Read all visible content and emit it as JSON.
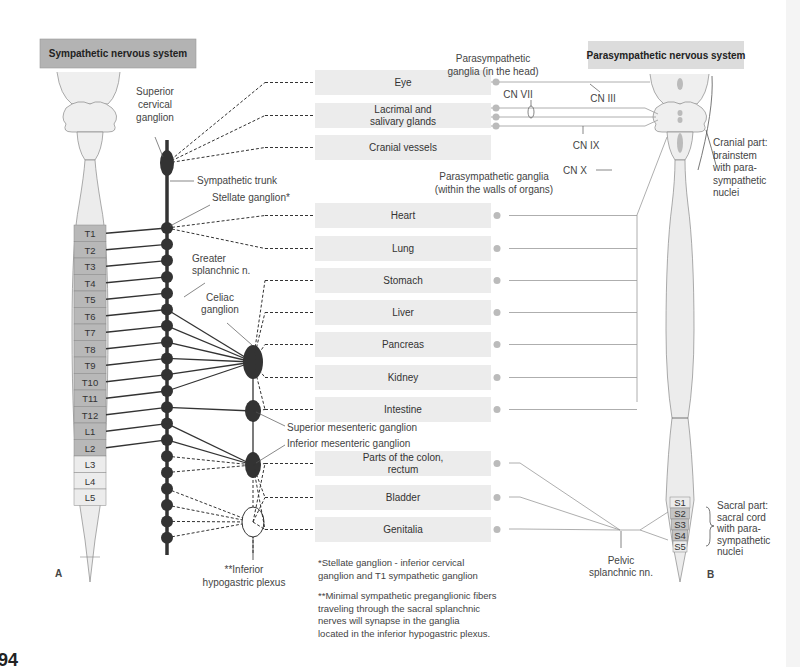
{
  "page_number": "94",
  "headers": {
    "sympathetic": "Sympathetic nervous system",
    "parasympathetic": "Parasympathetic nervous system",
    "sympathetic_color": "#b3b3b3",
    "parasympathetic_color": "#dcdcdc"
  },
  "panel_labels": {
    "left": "A",
    "right": "B"
  },
  "organs": [
    {
      "label": "Eye",
      "lines": [
        "Eye"
      ],
      "group": "head"
    },
    {
      "label": "Lacrimal and salivary glands",
      "lines": [
        "Lacrimal and",
        "salivary glands"
      ],
      "group": "head"
    },
    {
      "label": "Cranial vessels",
      "lines": [
        "Cranial vessels"
      ],
      "group": "head"
    },
    {
      "label": "Heart",
      "lines": [
        "Heart"
      ],
      "group": "vagal"
    },
    {
      "label": "Lung",
      "lines": [
        "Lung"
      ],
      "group": "vagal"
    },
    {
      "label": "Stomach",
      "lines": [
        "Stomach"
      ],
      "group": "vagal"
    },
    {
      "label": "Liver",
      "lines": [
        "Liver"
      ],
      "group": "vagal"
    },
    {
      "label": "Pancreas",
      "lines": [
        "Pancreas"
      ],
      "group": "vagal"
    },
    {
      "label": "Kidney",
      "lines": [
        "Kidney"
      ],
      "group": "vagal"
    },
    {
      "label": "Intestine",
      "lines": [
        "Intestine"
      ],
      "group": "vagal"
    },
    {
      "label": "Parts of the colon, rectum",
      "lines": [
        "Parts of the colon,",
        "rectum"
      ],
      "group": "pelvic"
    },
    {
      "label": "Bladder",
      "lines": [
        "Bladder"
      ],
      "group": "pelvic"
    },
    {
      "label": "Genitalia",
      "lines": [
        "Genitalia"
      ],
      "group": "pelvic"
    }
  ],
  "sympathetic_segments": {
    "active": [
      "T1",
      "T2",
      "T3",
      "T4",
      "T5",
      "T6",
      "T7",
      "T8",
      "T9",
      "T10",
      "T11",
      "T12",
      "L1",
      "L2"
    ],
    "inactive": [
      "L3",
      "L4",
      "L5"
    ],
    "active_color": "#b8b8b8",
    "inactive_color": "#ececec"
  },
  "sacral_segments": {
    "all": [
      "S1",
      "S2",
      "S3",
      "S4",
      "S5"
    ],
    "active": [
      "S2",
      "S3",
      "S4"
    ]
  },
  "labels": {
    "superior_cervical": [
      "Superior",
      "cervical",
      "ganglion"
    ],
    "sympathetic_trunk": "Sympathetic trunk",
    "stellate": "Stellate ganglion*",
    "greater_splanchnic": [
      "Greater",
      "splanchnic n."
    ],
    "celiac": [
      "Celiac",
      "ganglion"
    ],
    "superior_mesenteric": "Superior mesenteric ganglion",
    "inferior_mesenteric": "Inferior mesenteric ganglion",
    "inferior_hypogastric": [
      "**Inferior",
      "hypogastric plexus"
    ],
    "para_head": [
      "Parasympathetic",
      "ganglia (in the head)"
    ],
    "para_walls": [
      "Parasympathetic ganglia",
      "(within the walls of organs)"
    ],
    "cn_vii": "CN VII",
    "cn_iii": "CN III",
    "cn_ix": "CN IX",
    "cn_x": "CN X",
    "cranial_part": [
      "Cranial part:",
      "brainstem",
      "with para-",
      "sympathetic",
      "nuclei"
    ],
    "sacral_part": [
      "Sacral part:",
      "sacral cord",
      "with para-",
      "sympathetic",
      "nuclei"
    ],
    "pelvic_splanchnic": [
      "Pelvic",
      "splanchnic nn."
    ]
  },
  "footnotes": {
    "stellate": [
      "*Stellate ganglion - inferior cervical",
      "ganglion and T1 sympathetic ganglion"
    ],
    "minimal": [
      "**Minimal sympathetic preganglionic fibers",
      "traveling through the sacral splanchnic",
      "nerves will synapse in the ganglia",
      "located in the inferior hypogastric plexus."
    ]
  }
}
